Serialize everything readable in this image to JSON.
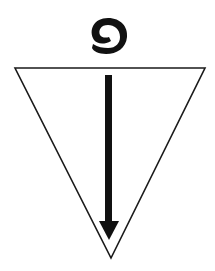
{
  "sign": {
    "symbol": "໑",
    "shape": "inverted-triangle",
    "arrow_direction": "down",
    "colors": {
      "background": "#ffffff",
      "stroke": "#1a1a1a",
      "arrow": "#111111"
    }
  }
}
